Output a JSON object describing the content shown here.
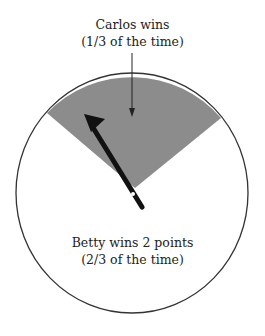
{
  "diagram": {
    "type": "spinner",
    "colors": {
      "wedge": "#8c8c8c",
      "circle_stroke": "#333333",
      "needle": "#111111",
      "background": "#ffffff"
    },
    "regions": [
      {
        "id": "carlos",
        "label_line1": "Carlos wins",
        "label_line2": "(1/3 of the time)",
        "fraction": "1/3",
        "shaded": true
      },
      {
        "id": "betty",
        "label_line1": "Betty wins 2 points",
        "label_line2": "(2/3 of the time)",
        "fraction": "2/3",
        "shaded": false
      }
    ]
  }
}
